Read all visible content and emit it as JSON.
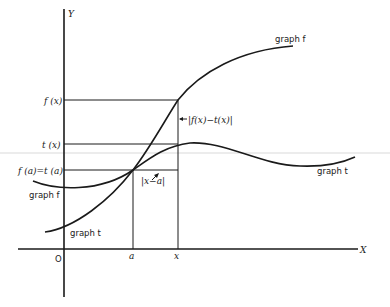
{
  "figure": {
    "axes": {
      "x_label": "X",
      "y_label": "Y",
      "origin_label": "O",
      "x_ticks": [
        "a",
        "x"
      ]
    },
    "y_levels": {
      "fx": "f (x)",
      "tx": "t (x)",
      "fa_ta": "f (a)=t (a)"
    },
    "curves": {
      "graph_f_right": "graph f",
      "graph_t_right": "graph t",
      "graph_f_left": "graph f",
      "graph_t_left": "graph t"
    },
    "annotations": {
      "vertical_gap": "|f(x)−t(x)|",
      "horizontal_gap": "|x−a|"
    }
  }
}
